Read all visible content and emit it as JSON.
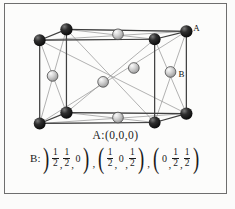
{
  "figure": {
    "type": "fcc-crystal-lattice",
    "background_color": "#fcfcfb",
    "border_color": "#6e6e6e"
  },
  "atoms": {
    "a_color": "#1c1c1c",
    "a_highlight": "#6f6f6f",
    "b_color": "#cfcfcf",
    "b_highlight": "#f2f2f2",
    "b_stroke": "#4a4a4a",
    "edge_color": "#4a4a4a",
    "diagonal_color": "#8a8a8a",
    "labels": [
      {
        "name": "A",
        "x": 190,
        "y": 26
      },
      {
        "name": "B",
        "x": 176,
        "y": 78
      }
    ],
    "corner_atoms": [
      {
        "id": "c-top-back-left",
        "cx": 62,
        "cy": 25,
        "r": 6.2
      },
      {
        "id": "c-top-back-right",
        "cx": 151,
        "cy": 35,
        "r": 6.0
      },
      {
        "id": "c-top-front-left",
        "cx": 35,
        "cy": 36,
        "r": 6.0
      },
      {
        "id": "c-top-front-right",
        "cx": 183,
        "cy": 27,
        "r": 6.2
      },
      {
        "id": "c-bot-back-left",
        "cx": 62,
        "cy": 109,
        "r": 6.2
      },
      {
        "id": "c-bot-back-right",
        "cx": 151,
        "cy": 119,
        "r": 6.0
      },
      {
        "id": "c-bot-front-left",
        "cx": 35,
        "cy": 120,
        "r": 6.0
      },
      {
        "id": "c-bot-front-right",
        "cx": 183,
        "cy": 110,
        "r": 6.2
      }
    ],
    "face_atoms": [
      {
        "id": "f-top",
        "cx": 114,
        "cy": 30,
        "r": 5.4
      },
      {
        "id": "f-bottom",
        "cx": 114,
        "cy": 114,
        "r": 5.4
      },
      {
        "id": "f-left",
        "cx": 48,
        "cy": 72,
        "r": 5.4
      },
      {
        "id": "f-right",
        "cx": 167,
        "cy": 68,
        "r": 5.4
      },
      {
        "id": "f-front",
        "cx": 99,
        "cy": 78,
        "r": 5.4
      },
      {
        "id": "f-back",
        "cx": 130,
        "cy": 64,
        "r": 5.4
      }
    ]
  },
  "captions": {
    "a_line": "A:(0,0,0)",
    "b_prefix": "B:",
    "b_groups": [
      {
        "items": [
          {
            "type": "frac",
            "num": "1",
            "den": "2"
          },
          {
            "type": "frac",
            "num": "1",
            "den": "2"
          },
          {
            "type": "zero",
            "value": "0"
          }
        ]
      },
      {
        "items": [
          {
            "type": "frac",
            "num": "1",
            "den": "2"
          },
          {
            "type": "zero",
            "value": "0"
          },
          {
            "type": "frac",
            "num": "1",
            "den": "2"
          }
        ]
      },
      {
        "items": [
          {
            "type": "zero",
            "value": "0"
          },
          {
            "type": "frac",
            "num": "1",
            "den": "2"
          },
          {
            "type": "frac",
            "num": "1",
            "den": "2"
          }
        ]
      }
    ],
    "separator": ",",
    "paren_open": "(",
    "paren_close": ")"
  }
}
